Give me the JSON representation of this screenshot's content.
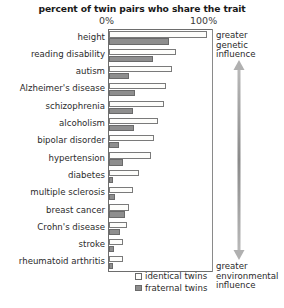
{
  "chart_data": {
    "type": "bar",
    "orientation": "horizontal",
    "title": "percent of twin pairs who share the trait",
    "xlabel": "",
    "ylabel": "",
    "xlim": [
      0,
      100
    ],
    "xticks": [
      "0%",
      "100%"
    ],
    "xtick_values": [
      0,
      100
    ],
    "grid": false,
    "legend_position": "bottom-inside",
    "categories": [
      "height",
      "reading disability",
      "autism",
      "Alzheimer's disease",
      "schizophrenia",
      "alcoholism",
      "bipolar disorder",
      "hypertension",
      "diabetes",
      "multiple sclerosis",
      "breast cancer",
      "Crohn's disease",
      "stroke",
      "rheumatoid arthritis"
    ],
    "series": [
      {
        "name": "identical twins",
        "color": "#fdfdfb",
        "values": [
          95,
          65,
          61,
          55,
          53,
          48,
          44,
          41,
          29,
          23,
          19,
          17,
          14,
          14
        ]
      },
      {
        "name": "fraternal twins",
        "color": "#8e8e8e",
        "values": [
          58,
          43,
          19,
          25,
          23,
          24,
          10,
          14,
          4,
          6,
          16,
          11,
          5,
          4
        ]
      }
    ],
    "annotations": [
      {
        "id": "genetic",
        "text": "greater\ngenetic\ninfluence",
        "position": "top-right"
      },
      {
        "id": "environmental",
        "text": "greater\nenvironmental\ninfluence",
        "position": "bottom-right"
      }
    ]
  },
  "title": "percent of twin pairs who share the trait",
  "axis": {
    "tick_min": "0%",
    "tick_max": "100%"
  },
  "traits": [
    {
      "label": "height",
      "identical": 95,
      "fraternal": 58
    },
    {
      "label": "reading disability",
      "identical": 65,
      "fraternal": 43
    },
    {
      "label": "autism",
      "identical": 61,
      "fraternal": 19
    },
    {
      "label": "Alzheimer's disease",
      "identical": 55,
      "fraternal": 25
    },
    {
      "label": "schizophrenia",
      "identical": 53,
      "fraternal": 23
    },
    {
      "label": "alcoholism",
      "identical": 48,
      "fraternal": 24
    },
    {
      "label": "bipolar disorder",
      "identical": 44,
      "fraternal": 10
    },
    {
      "label": "hypertension",
      "identical": 41,
      "fraternal": 14
    },
    {
      "label": "diabetes",
      "identical": 29,
      "fraternal": 4
    },
    {
      "label": "multiple sclerosis",
      "identical": 23,
      "fraternal": 6
    },
    {
      "label": "breast cancer",
      "identical": 19,
      "fraternal": 16
    },
    {
      "label": "Crohn's disease",
      "identical": 17,
      "fraternal": 11
    },
    {
      "label": "stroke",
      "identical": 14,
      "fraternal": 5
    },
    {
      "label": "rheumatoid arthritis",
      "identical": 14,
      "fraternal": 4
    }
  ],
  "annotations": {
    "genetic_line1": "greater",
    "genetic_line2": "genetic",
    "genetic_line3": "influence",
    "environmental_line1": "greater",
    "environmental_line2": "environmental",
    "environmental_line3": "influence"
  },
  "legend": {
    "identical_label": "identical twins",
    "fraternal_label": "fraternal twins"
  },
  "colors": {
    "identical_fill": "#fdfdfb",
    "fraternal_fill": "#8e8e8e",
    "axis": "#6d6d6d",
    "text": "#2b2b2b",
    "arrow": "#8a8a8a"
  }
}
